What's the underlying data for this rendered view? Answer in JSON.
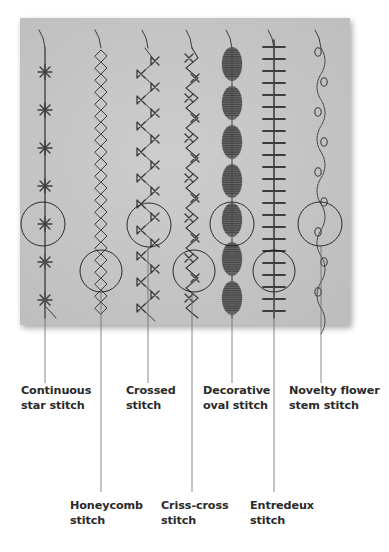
{
  "figure": {
    "photo": {
      "x": 20,
      "y": 18,
      "width": 330,
      "height": 307,
      "background_color": "#c6c6c6",
      "thread_color": "#3c3c3c"
    },
    "stitches": [
      {
        "id": "continuous-star",
        "line1": "Continuous",
        "line2": "star stitch",
        "x": 45,
        "circle": {
          "cx": 43,
          "cy": 224,
          "r": 22
        },
        "label_row": "top",
        "label_x": 21
      },
      {
        "id": "honeycomb",
        "line1": "Honeycomb",
        "line2": "stitch",
        "x": 101,
        "circle": {
          "cx": 101,
          "cy": 271,
          "r": 21
        },
        "label_row": "bottom",
        "label_x": 70
      },
      {
        "id": "crossed",
        "line1": "Crossed",
        "line2": "stitch",
        "x": 148,
        "circle": {
          "cx": 149,
          "cy": 225,
          "r": 22
        },
        "label_row": "top",
        "label_x": 126
      },
      {
        "id": "criss-cross",
        "line1": "Criss-cross",
        "line2": "stitch",
        "x": 192,
        "circle": {
          "cx": 194,
          "cy": 271,
          "r": 21
        },
        "label_row": "bottom",
        "label_x": 161
      },
      {
        "id": "decorative-oval",
        "line1": "Decorative",
        "line2": "oval stitch",
        "x": 232,
        "circle": {
          "cx": 232,
          "cy": 224,
          "r": 22
        },
        "label_row": "top",
        "label_x": 203
      },
      {
        "id": "entredeux",
        "line1": "Entredeux",
        "line2": "stitch",
        "x": 274,
        "circle": {
          "cx": 274,
          "cy": 271,
          "r": 21
        },
        "label_row": "bottom",
        "label_x": 250
      },
      {
        "id": "novelty-flower-stem",
        "line1": "Novelty flower",
        "line2": "stem stitch",
        "x": 321,
        "circle": {
          "cx": 320,
          "cy": 224,
          "r": 22
        },
        "label_row": "top",
        "label_x": 289
      }
    ],
    "leader_color": "#6a6a6a",
    "top_label_y": 384,
    "bottom_label_y": 499,
    "top_leader_end": 383,
    "bottom_leader_end": 492
  }
}
